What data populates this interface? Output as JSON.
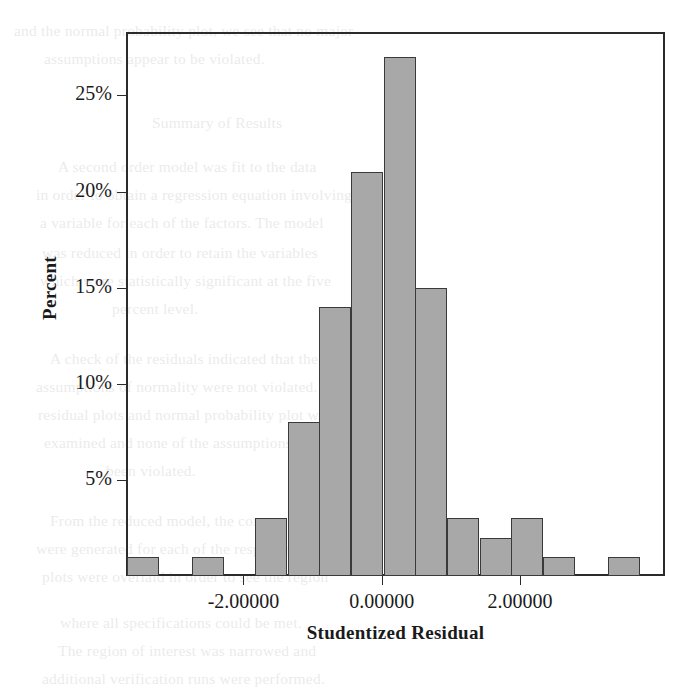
{
  "chart_data": {
    "type": "bar",
    "title": "",
    "subtitle": "",
    "xlabel": "Studentized Residual",
    "ylabel": "Percent",
    "xlim": [
      -3.7,
      4.1
    ],
    "ylim": [
      0,
      28.3
    ],
    "grid": false,
    "legend": null,
    "bar_fill_color": "#a8a8a8",
    "bar_edge_color": "#3a3a3a",
    "axis_color": "#2b2b2b",
    "background_color": "#ffffff",
    "bin_width": 0.4636,
    "y_unit": "%",
    "ytick_labels": [
      "5%",
      "10%",
      "15%",
      "20%",
      "25%"
    ],
    "ytick_values": [
      5,
      10,
      15,
      20,
      25
    ],
    "xtick_labels": [
      "-2.00000",
      "0.00000",
      "2.00000"
    ],
    "xtick_values": [
      -2,
      0,
      2
    ],
    "bins": [
      {
        "center": -3.45,
        "value": 1
      },
      {
        "center": -2.99,
        "value": 0
      },
      {
        "center": -2.52,
        "value": 1
      },
      {
        "center": -2.06,
        "value": 0
      },
      {
        "center": -1.6,
        "value": 3
      },
      {
        "center": -1.13,
        "value": 8
      },
      {
        "center": -0.67,
        "value": 14
      },
      {
        "center": -0.21,
        "value": 21
      },
      {
        "center": 0.26,
        "value": 27
      },
      {
        "center": 0.72,
        "value": 15
      },
      {
        "center": 1.18,
        "value": 3
      },
      {
        "center": 1.65,
        "value": 2
      },
      {
        "center": 2.11,
        "value": 3
      },
      {
        "center": 2.57,
        "value": 1
      },
      {
        "center": 3.04,
        "value": 0
      },
      {
        "center": 3.5,
        "value": 1
      }
    ],
    "categories": [
      "-3.45",
      "-2.99",
      "-2.52",
      "-2.06",
      "-1.60",
      "-1.13",
      "-0.67",
      "-0.21",
      "0.26",
      "0.72",
      "1.18",
      "1.65",
      "2.11",
      "2.57",
      "3.04",
      "3.50"
    ],
    "values": [
      1,
      0,
      1,
      0,
      3,
      8,
      14,
      21,
      27,
      15,
      3,
      2,
      3,
      1,
      0,
      1
    ]
  },
  "page_background": {
    "lines": [
      {
        "text": "and the normal probability plot, we see that no major",
        "x": 14,
        "y": 16
      },
      {
        "text": "assumptions appear to be violated.",
        "x": 44,
        "y": 44
      },
      {
        "text": "Summary of Results",
        "x": 152,
        "y": 108
      },
      {
        "text": "A second order model was fit to the data",
        "x": 58,
        "y": 152
      },
      {
        "text": "in order to obtain a regression equation involving",
        "x": 36,
        "y": 180
      },
      {
        "text": "a variable for each of the factors. The model",
        "x": 40,
        "y": 208
      },
      {
        "text": "was reduced in order to retain the variables",
        "x": 42,
        "y": 238
      },
      {
        "text": "which were statistically significant at the five",
        "x": 40,
        "y": 266
      },
      {
        "text": "percent level.",
        "x": 112,
        "y": 294
      },
      {
        "text": "A check of the residuals indicated that the",
        "x": 50,
        "y": 344
      },
      {
        "text": "assumptions of normality were not violated. The",
        "x": 36,
        "y": 372
      },
      {
        "text": "residual plots and normal probability plot were",
        "x": 38,
        "y": 400
      },
      {
        "text": "examined and none of the assumptions have",
        "x": 44,
        "y": 428
      },
      {
        "text": "been violated.",
        "x": 106,
        "y": 456
      },
      {
        "text": "From the reduced model, the contour plots",
        "x": 50,
        "y": 506
      },
      {
        "text": "were generated for each of the responses. These",
        "x": 36,
        "y": 534
      },
      {
        "text": "plots were overlaid in order to see the region",
        "x": 42,
        "y": 562
      },
      {
        "text": "where all specifications could be met.",
        "x": 60,
        "y": 608
      },
      {
        "text": "The region of interest was narrowed and",
        "x": 58,
        "y": 636
      },
      {
        "text": "additional verification runs were performed.",
        "x": 42,
        "y": 664
      }
    ]
  }
}
